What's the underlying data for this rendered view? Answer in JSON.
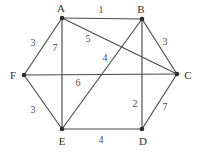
{
  "figure": {
    "type": "weighted-undirected-graph",
    "background_color": "#ffffff",
    "edge_color": "#4a4a4a",
    "node_color": "#2b2b2b",
    "label_color": "#2f2f2f",
    "width": 199,
    "height": 155
  },
  "nodes": [
    {
      "id": "A",
      "label": "A",
      "x": 62,
      "y": 18,
      "label_x": 61,
      "label_y": 8
    },
    {
      "id": "B",
      "label": "B",
      "x": 142,
      "y": 19,
      "label_x": 141,
      "label_y": 9
    },
    {
      "id": "C",
      "label": "C",
      "x": 177,
      "y": 74,
      "label_x": 188,
      "label_y": 75
    },
    {
      "id": "D",
      "label": "D",
      "x": 142,
      "y": 129,
      "label_x": 143,
      "label_y": 141
    },
    {
      "id": "E",
      "label": "E",
      "x": 62,
      "y": 129,
      "label_x": 62,
      "label_y": 141
    },
    {
      "id": "F",
      "label": "F",
      "x": 24,
      "y": 75,
      "label_x": 13,
      "label_y": 75
    }
  ],
  "edges": [
    {
      "from": "A",
      "to": "B",
      "weight": "1",
      "label_x": 101,
      "label_y": 10
    },
    {
      "from": "A",
      "to": "F",
      "weight": "3",
      "label_x": 33,
      "label_y": 43
    },
    {
      "from": "A",
      "to": "E",
      "weight": "7",
      "label_x": 55,
      "label_y": 48
    },
    {
      "from": "A",
      "to": "C",
      "weight": "5",
      "label_x": 88,
      "label_y": 39
    },
    {
      "from": "B",
      "to": "C",
      "weight": "3",
      "label_x": 165,
      "label_y": 42
    },
    {
      "from": "B",
      "to": "E",
      "weight": "4",
      "label_x": 105,
      "label_y": 58
    },
    {
      "from": "B",
      "to": "D",
      "weight": "2",
      "label_x": 135,
      "label_y": 104
    },
    {
      "from": "F",
      "to": "C",
      "weight": "6",
      "label_x": 78,
      "label_y": 83
    },
    {
      "from": "F",
      "to": "E",
      "weight": "3",
      "label_x": 33,
      "label_y": 110
    },
    {
      "from": "E",
      "to": "D",
      "weight": "4",
      "label_x": 101,
      "label_y": 140
    },
    {
      "from": "D",
      "to": "C",
      "weight": "7",
      "label_x": 165,
      "label_y": 107
    }
  ]
}
